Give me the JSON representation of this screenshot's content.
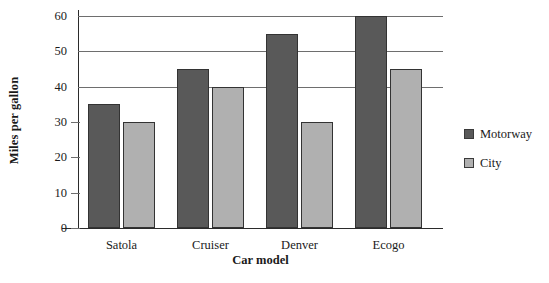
{
  "chart_data": {
    "type": "bar",
    "title": "",
    "subtitle": "",
    "xlabel": "Car model",
    "ylabel": "Miles per gallon",
    "categories": [
      "Satola",
      "Cruiser",
      "Denver",
      "Ecogo"
    ],
    "series": [
      {
        "name": "Motorway",
        "values": [
          35,
          45,
          55,
          60
        ],
        "color": "#595959"
      },
      {
        "name": "City",
        "values": [
          30,
          40,
          30,
          45
        ],
        "color": "#b0b0b0"
      }
    ],
    "ylim": [
      0,
      60
    ],
    "yticks": [
      0,
      10,
      20,
      30,
      40,
      50,
      60
    ],
    "ytick_labels": [
      "0",
      "10",
      "20",
      "30",
      "40",
      "50",
      "60"
    ],
    "grid": "horizontal",
    "gridlines_at": [
      40,
      50,
      60
    ],
    "legend_position": "right",
    "axis_color": "#2b2b2b",
    "grid_color": "#6e6e6e",
    "background": "#ffffff"
  },
  "legend": {
    "entries": [
      {
        "label": "Motorway",
        "swatch": "motorway-swatch"
      },
      {
        "label": "City",
        "swatch": "city-swatch"
      }
    ]
  }
}
